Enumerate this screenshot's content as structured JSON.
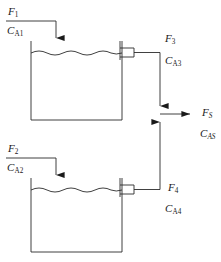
{
  "diagram": {
    "type": "process-flow-diagram",
    "background_color": "#ffffff",
    "line_color": "#2b2b2b",
    "text_color": "#1a1a1a",
    "width": 221,
    "height": 262
  },
  "streams": {
    "feed_1": {
      "flow_symbol": "F",
      "flow_subscript": "1",
      "conc_symbol": "C",
      "conc_subscript": "A1",
      "role": "inlet to top tank"
    },
    "feed_2": {
      "flow_symbol": "F",
      "flow_subscript": "2",
      "conc_symbol": "C",
      "conc_subscript": "A2",
      "role": "inlet to bottom tank"
    },
    "outlet_3": {
      "flow_symbol": "F",
      "flow_subscript": "3",
      "conc_symbol": "C",
      "conc_subscript": "A3",
      "role": "overflow outlet from top tank"
    },
    "outlet_4": {
      "flow_symbol": "F",
      "flow_subscript": "4",
      "conc_symbol": "C",
      "conc_subscript": "A4",
      "role": "overflow outlet from bottom tank"
    },
    "combined": {
      "flow_symbol": "F",
      "flow_subscript": "S",
      "conc_symbol": "C",
      "conc_subscript": "AS",
      "role": "combined product stream"
    }
  },
  "vessels": {
    "tank_top": {
      "name": "Tank 1",
      "has_liquid_surface": true
    },
    "tank_bottom": {
      "name": "Tank 2",
      "has_liquid_surface": true
    }
  }
}
